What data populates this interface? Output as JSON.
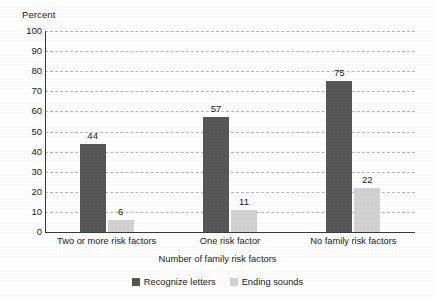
{
  "chart_data": {
    "type": "bar",
    "title": "",
    "subtitle": "",
    "xlabel": "Number of family risk factors",
    "ylabel": "Percent",
    "ylim": [
      0,
      100
    ],
    "ytick_step": 10,
    "yticks": [
      100,
      90,
      80,
      70,
      60,
      50,
      40,
      30,
      20,
      10,
      0
    ],
    "grid": true,
    "grid_style": "dashed-horizontal",
    "legend_position": "bottom-center",
    "categories": [
      "Two or more risk factors",
      "One risk factor",
      "No family risk factors"
    ],
    "series": [
      {
        "name": "Recognize letters",
        "color": "#575757",
        "values": [
          44,
          57,
          75
        ]
      },
      {
        "name": "Ending sounds",
        "color": "#d3d3d3",
        "values": [
          6,
          11,
          22
        ]
      }
    ],
    "data_labels": [
      [
        "44",
        "6"
      ],
      [
        "57",
        "11"
      ],
      [
        "75",
        "22"
      ]
    ]
  },
  "axes": {
    "y_title": "Percent",
    "x_title": "Number of family risk factors",
    "y_tick_labels": [
      "100",
      "90",
      "80",
      "70",
      "60",
      "50",
      "40",
      "30",
      "20",
      "10",
      "0"
    ],
    "x_tick_labels": [
      "Two or more risk factors",
      "One risk factor",
      "No family risk factors"
    ]
  },
  "legend": {
    "items": [
      {
        "label": "Recognize letters",
        "color": "#575757"
      },
      {
        "label": "Ending sounds",
        "color": "#d3d3d3"
      }
    ]
  },
  "colors": {
    "series_dark": "#575757",
    "series_light": "#d3d3d3",
    "axis": "#3a3a3a",
    "grid": "#b9b9b9",
    "text": "#1a1a1a",
    "background": "#ffffff"
  }
}
